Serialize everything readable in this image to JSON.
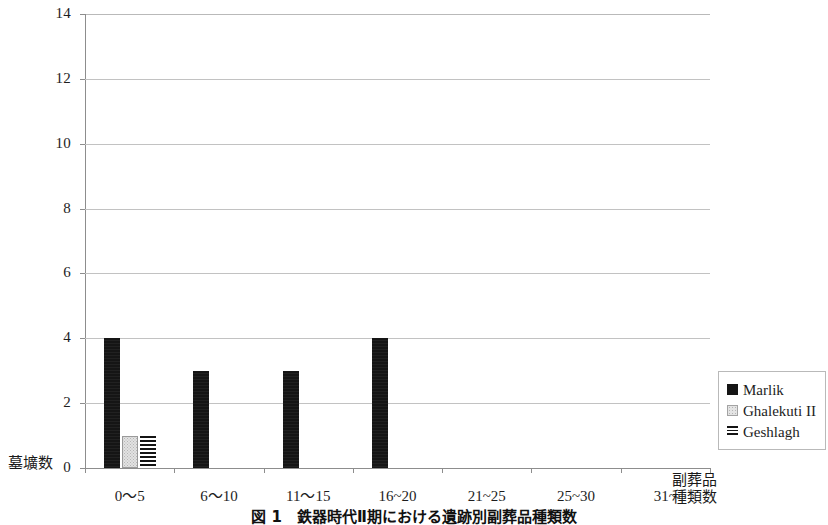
{
  "chart_data": {
    "type": "bar",
    "title": "図 1　鉄器時代Ⅱ期における遺跡別副葬品種類数",
    "xlabel": "副葬品\n種類数",
    "xlabel_line1": "副葬品",
    "xlabel_line2": "種類数",
    "ylabel": "墓壙数",
    "categories": [
      "0〜5",
      "6〜10",
      "11〜15",
      "16~20",
      "21~25",
      "25~30",
      "31~"
    ],
    "series": [
      {
        "name": "Marlik",
        "values": [
          4,
          3,
          3,
          4,
          0,
          0,
          0
        ],
        "fill": "solid-black",
        "color": "#151515"
      },
      {
        "name": "Ghalekuti II",
        "values": [
          1,
          0,
          0,
          0,
          0,
          0,
          0
        ],
        "fill": "light-dotted",
        "color": "#e2e2e2"
      },
      {
        "name": "Geshlagh",
        "values": [
          1,
          0,
          0,
          0,
          0,
          0,
          0
        ],
        "fill": "horizontal-stripes",
        "color": "#141414"
      }
    ],
    "ylim": [
      0,
      14
    ],
    "yticks": [
      "0",
      "2",
      "4",
      "6",
      "8",
      "10",
      "12",
      "14"
    ],
    "ytick_values": [
      0,
      2,
      4,
      6,
      8,
      10,
      12,
      14
    ],
    "grid": "horizontal",
    "legend_position": "right-bottom"
  },
  "axes": {
    "y_label": "墓壙数",
    "x_label_line1": "副葬品",
    "x_label_line2": "種類数"
  },
  "legend": {
    "entries": [
      {
        "label": "Marlik",
        "swatch": "solid-square-icon"
      },
      {
        "label": "Ghalekuti II",
        "swatch": "dotted-square-icon"
      },
      {
        "label": "Geshlagh",
        "swatch": "striped-square-icon"
      }
    ]
  },
  "caption": {
    "text": "図 1　鉄器時代Ⅱ期における遺跡別副葬品種類数"
  }
}
